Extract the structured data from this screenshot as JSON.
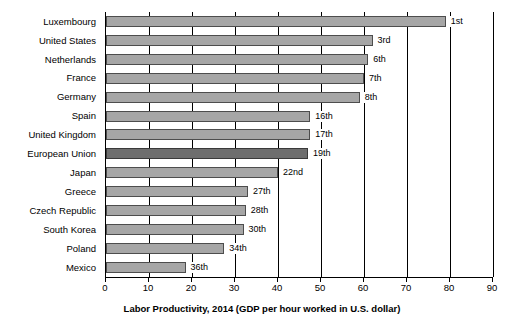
{
  "chart_data": {
    "type": "bar",
    "orientation": "horizontal",
    "title": "",
    "xlabel": "Labor Productivity, 2014 (GDP per hour worked in U.S. dollar)",
    "ylabel": "",
    "xlim": [
      0,
      90
    ],
    "xticks": [
      0,
      10,
      20,
      30,
      40,
      50,
      60,
      70,
      80,
      90
    ],
    "grid": true,
    "legend": false,
    "categories": [
      "Luxembourg",
      "United States",
      "Netherlands",
      "France",
      "Germany",
      "Spain",
      "United Kingdom",
      "European Union",
      "Japan",
      "Greece",
      "Czech Republic",
      "South Korea",
      "Poland",
      "Mexico"
    ],
    "values": [
      79,
      62,
      61,
      60,
      59,
      47.5,
      47.5,
      47,
      40,
      33,
      32.5,
      32,
      27.5,
      18.5
    ],
    "annotations": [
      "1st",
      "3rd",
      "6th",
      "7th",
      "8th",
      "16th",
      "17th",
      "19th",
      "22nd",
      "27th",
      "28th",
      "30th",
      "34th",
      "36th"
    ],
    "highlight_category": "European Union",
    "colors": {
      "bar_fill": "#a6a6a6",
      "bar_edge": "#4d4d4d",
      "highlight_fill": "#6e6e6e",
      "highlight_edge": "#3a3a3a",
      "axis": "#000000",
      "background": "#ffffff"
    }
  }
}
